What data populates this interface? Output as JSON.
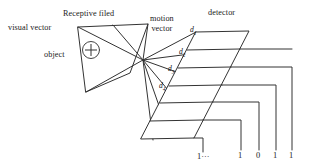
{
  "figure": {
    "background_color": "#ffffff",
    "stroke_color": "#333333",
    "text_color": "#1a1a1a"
  },
  "labels": {
    "visual_vector": "visual vector",
    "receptive_field": "Receptive filed",
    "object": "object",
    "motion_vector_line1": "motion",
    "motion_vector_line2": "vector",
    "detector": "detector",
    "object_marker_icon": "circled-plus-icon"
  },
  "distance_labels": [
    {
      "name": "d1",
      "base": "d",
      "sub": "1"
    },
    {
      "name": "d2",
      "base": "d",
      "sub": "2"
    },
    {
      "name": "d3",
      "base": "d",
      "sub": "3"
    },
    {
      "name": "d4",
      "base": "d",
      "sub": "4"
    }
  ],
  "output_bits": {
    "ellipsis_label": "1···",
    "values": [
      "1",
      "0",
      "1",
      "1"
    ]
  },
  "geometry": {
    "receptive_field_polygon": "78,27 148,24 130,73 86,92",
    "convergence_vertex": "143,60",
    "object_marker_center": "91,50",
    "object_marker_radius": 8.5,
    "detector_cell_count": 6,
    "wire_count": 5
  }
}
